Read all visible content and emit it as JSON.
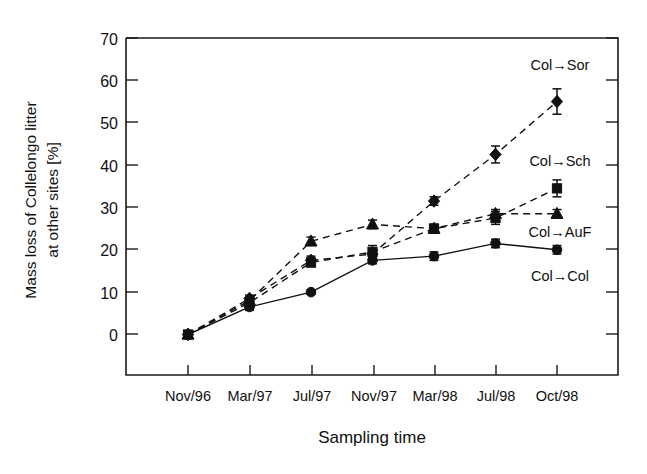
{
  "chart_data": {
    "type": "line",
    "title": "",
    "xlabel": "Sampling time",
    "ylabel": "Mass loss of Collelongo litter at other sites [%]",
    "ylabel_lines": [
      "Mass loss of Collelongo litter",
      "at other sites [%]"
    ],
    "categories": [
      "Nov/96",
      "Mar/97",
      "Jul/97",
      "Nov/97",
      "Mar/98",
      "Jul/98",
      "Oct/98"
    ],
    "ylim": [
      0,
      70
    ],
    "yticks": [
      0,
      10,
      20,
      30,
      40,
      50,
      60,
      70
    ],
    "ytick_labels": [
      "0",
      "10",
      "20",
      "30",
      "40",
      "50",
      "60",
      "70"
    ],
    "grid": false,
    "legend_position": "inline-right",
    "series": [
      {
        "name": "Col→Sor",
        "marker": "diamond",
        "line_style": "dashed",
        "values": [
          0,
          8.5,
          17.5,
          19.0,
          31.5,
          42.5,
          55.0
        ],
        "errors": [
          0,
          0.8,
          1.0,
          1.0,
          1.0,
          2.0,
          3.0
        ]
      },
      {
        "name": "Col→Sch",
        "marker": "square",
        "line_style": "dashed",
        "values": [
          0,
          7.5,
          17.0,
          19.5,
          25.0,
          27.5,
          34.5
        ],
        "errors": [
          0,
          0.8,
          1.0,
          1.5,
          1.0,
          1.5,
          2.0
        ]
      },
      {
        "name": "Col→AuF",
        "marker": "triangle",
        "line_style": "dashed",
        "values": [
          0,
          8.0,
          22.0,
          26.0,
          25.0,
          28.5,
          28.5
        ],
        "errors": [
          0,
          0.8,
          1.0,
          1.0,
          1.0,
          1.0,
          1.0
        ]
      },
      {
        "name": "Col→Col",
        "marker": "circle",
        "line_style": "solid",
        "values": [
          0,
          6.5,
          10.0,
          17.5,
          18.5,
          21.5,
          20.0
        ],
        "errors": [
          0,
          0.8,
          0.5,
          0.8,
          1.0,
          1.0,
          1.0
        ]
      }
    ],
    "annotations": [
      {
        "text": "Col→Sor",
        "x": 560,
        "y": 70
      },
      {
        "text": "Col→Sch",
        "x": 560,
        "y": 166
      },
      {
        "text": "Col→AuF",
        "x": 560,
        "y": 237
      },
      {
        "text": "Col→Col",
        "x": 560,
        "y": 281
      }
    ]
  }
}
